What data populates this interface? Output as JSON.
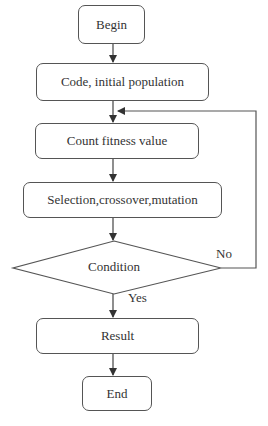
{
  "diagram": {
    "type": "flowchart",
    "nodes": {
      "begin": "Begin",
      "code": "Code, initial population",
      "count": "Count fitness value",
      "selection": "Selection,crossover,mutation",
      "condition": "Condition",
      "result": "Result",
      "end": "End"
    },
    "edge_labels": {
      "yes": "Yes",
      "no": "No"
    },
    "edges": [
      [
        "Begin",
        "Code, initial population"
      ],
      [
        "Code, initial population",
        "Count fitness value"
      ],
      [
        "Count fitness value",
        "Selection,crossover,mutation"
      ],
      [
        "Selection,crossover,mutation",
        "Condition"
      ],
      [
        "Condition",
        "Result",
        "Yes"
      ],
      [
        "Condition",
        "Count fitness value",
        "No"
      ],
      [
        "Result",
        "End"
      ]
    ],
    "colors": {
      "stroke": "#555555",
      "text": "#333333",
      "background": "#ffffff"
    }
  }
}
